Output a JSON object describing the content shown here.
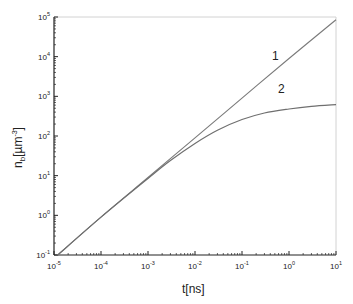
{
  "chart_data": {
    "type": "line",
    "title": "",
    "xlabel": "t[ns]",
    "ylabel": "n_b [µm^-3]",
    "xscale": "log",
    "yscale": "log",
    "xlim": [
      1e-05,
      10
    ],
    "ylim": [
      0.1,
      100000
    ],
    "x_ticks": [
      "10^-5",
      "10^-4",
      "10^-3",
      "10^-2",
      "10^-1",
      "10^0",
      "10^1"
    ],
    "y_ticks": [
      "10^-1",
      "10^0",
      "10^1",
      "10^2",
      "10^3",
      "10^4",
      "10^5"
    ],
    "grid": false,
    "legend": "none (inline curve labels)",
    "series": [
      {
        "name": "1",
        "x": [
          1.2e-05,
          0.0001,
          0.001,
          0.01,
          0.1,
          1,
          10
        ],
        "y": [
          0.1,
          0.9,
          9,
          90,
          900,
          9000,
          85000
        ]
      },
      {
        "name": "2",
        "x": [
          1.2e-05,
          0.0001,
          0.001,
          0.003,
          0.01,
          0.03,
          0.1,
          0.3,
          1,
          3,
          10
        ],
        "y": [
          0.1,
          0.9,
          8.5,
          24,
          65,
          140,
          260,
          380,
          480,
          560,
          620
        ]
      }
    ],
    "annotations": [
      {
        "text": "1",
        "near_x": 0.5,
        "near_y": 12000
      },
      {
        "text": "2",
        "near_x": 0.8,
        "near_y": 1100
      }
    ]
  },
  "axes": {
    "x_title_main": "t[ns]",
    "y_title_main": "n",
    "y_title_sub": "b",
    "y_title_unit_open": "[µm",
    "y_title_unit_exp": "-3",
    "y_title_unit_close": "]",
    "x_tick_exps": [
      "-5",
      "-4",
      "-3",
      "-2",
      "-1",
      "0",
      "1"
    ],
    "y_tick_exps": [
      "-1",
      "0",
      "1",
      "2",
      "3",
      "4",
      "5"
    ],
    "base": "10"
  },
  "labels": {
    "curve1": "1",
    "curve2": "2"
  },
  "colors": {
    "curve": "#7a7a7a",
    "axis": "#222222",
    "frame": "#cfcfcf"
  }
}
